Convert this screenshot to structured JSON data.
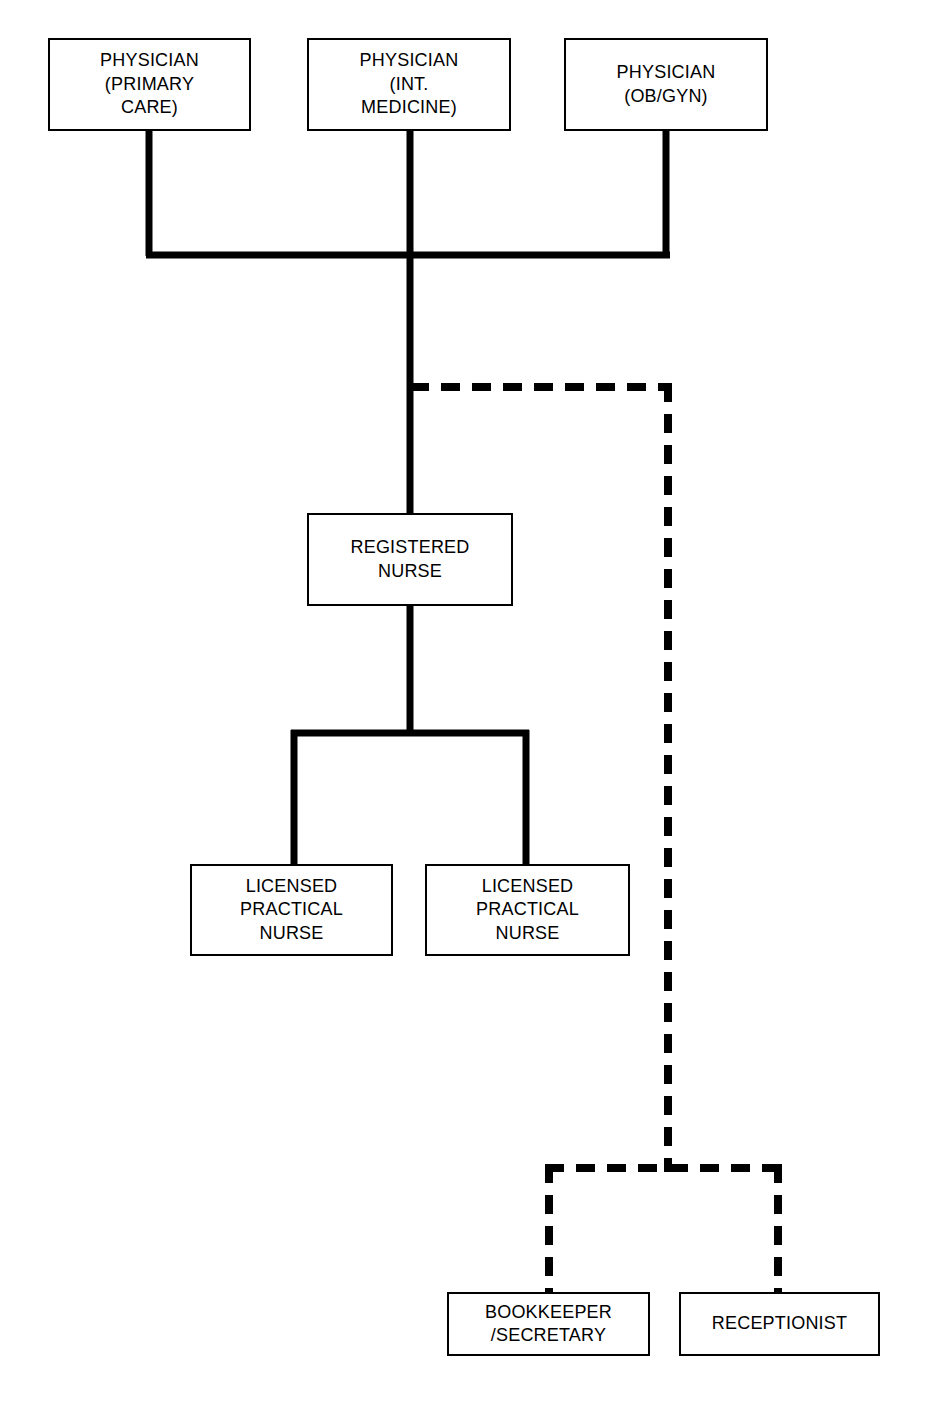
{
  "diagram": {
    "type": "organizational-chart",
    "background_color": "#ffffff",
    "line_color": "#000000",
    "box_border_color": "#000000",
    "box_fill_color": "#ffffff",
    "solid_line_meaning": "direct reporting relationship",
    "dashed_line_meaning": "indirect / administrative reporting relationship"
  },
  "nodes": {
    "physician_primary_care": {
      "label": "PHYSICIAN\n(PRIMARY\nCARE)",
      "line_style": "solid",
      "level": 1
    },
    "physician_internal_medicine": {
      "label": "PHYSICIAN\n(INT.\nMEDICINE)",
      "line_style": "solid",
      "level": 1
    },
    "physician_obgyn": {
      "label": "PHYSICIAN\n(OB/GYN)",
      "line_style": "solid",
      "level": 1
    },
    "registered_nurse": {
      "label": "REGISTERED\nNURSE",
      "line_style": "solid",
      "level": 2
    },
    "licensed_practical_nurse_1": {
      "label": "LICENSED\nPRACTICAL\nNURSE",
      "line_style": "solid",
      "level": 3
    },
    "licensed_practical_nurse_2": {
      "label": "LICENSED\nPRACTICAL\nNURSE",
      "line_style": "solid",
      "level": 3
    },
    "bookkeeper_secretary": {
      "label": "BOOKKEEPER\n/SECRETARY",
      "line_style": "dashed",
      "level": 3
    },
    "receptionist": {
      "label": "RECEPTIONIST",
      "line_style": "dashed",
      "level": 3
    }
  },
  "edges": [
    {
      "from": "physician_primary_care",
      "to": "physician-bus",
      "style": "solid"
    },
    {
      "from": "physician_internal_medicine",
      "to": "physician-bus",
      "style": "solid"
    },
    {
      "from": "physician_obgyn",
      "to": "physician-bus",
      "style": "solid"
    },
    {
      "from": "physician-bus",
      "to": "registered_nurse",
      "style": "solid"
    },
    {
      "from": "registered_nurse",
      "to": "licensed_practical_nurse_1",
      "style": "solid"
    },
    {
      "from": "registered_nurse",
      "to": "licensed_practical_nurse_2",
      "style": "solid"
    },
    {
      "from": "physician-trunk",
      "to": "bookkeeper_secretary",
      "style": "dashed"
    },
    {
      "from": "physician-trunk",
      "to": "receptionist",
      "style": "dashed"
    }
  ]
}
